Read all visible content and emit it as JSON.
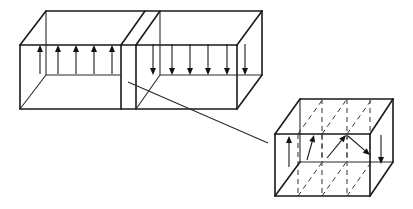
{
  "diagram": {
    "colors": {
      "line": "#1a1a1a",
      "background": "#ffffff"
    },
    "large_box": {
      "front_face": [
        [
          20,
          45
        ],
        [
          237,
          45
        ],
        [
          237,
          109
        ],
        [
          20,
          109
        ]
      ],
      "back_face": [
        [
          46,
          11
        ],
        [
          262,
          11
        ],
        [
          262,
          75
        ],
        [
          46,
          75
        ]
      ],
      "domain_wall_front": [
        [
          121,
          45
        ],
        [
          136,
          45
        ],
        [
          136,
          109
        ],
        [
          121,
          109
        ]
      ],
      "domain_wall_back": [
        [
          145,
          11
        ],
        [
          160,
          11
        ]
      ],
      "left_domain_arrows": {
        "direction": "up",
        "x": [
          40,
          58,
          76,
          94,
          112
        ],
        "y_from": 74,
        "y_to": 45
      },
      "right_domain_arrows": {
        "direction": "down",
        "x": [
          153,
          172,
          190,
          208,
          227,
          245
        ],
        "y_from": 44,
        "y_to": 75
      }
    },
    "connector_line": {
      "from": [
        128,
        82
      ],
      "to": [
        268,
        143
      ]
    },
    "magnified_wall": {
      "front_face": [
        [
          275,
          134
        ],
        [
          370,
          134
        ],
        [
          370,
          196
        ],
        [
          275,
          196
        ]
      ],
      "back_face": [
        [
          300,
          99
        ],
        [
          393,
          99
        ],
        [
          393,
          162
        ],
        [
          300,
          162
        ]
      ],
      "dashed_planes_front_x": [
        298,
        322,
        347
      ],
      "dashed_planes_back_x": [
        322,
        347,
        370
      ],
      "spin_arrows": [
        {
          "from": [
            289,
            167
          ],
          "to": [
            289,
            136
          ],
          "label": "up"
        },
        {
          "from": [
            307,
            160
          ],
          "to": [
            314,
            135
          ],
          "label": "tilted"
        },
        {
          "from": [
            327,
            158
          ],
          "to": [
            346,
            135
          ],
          "label": "tilted-more"
        },
        {
          "from": [
            348,
            136
          ],
          "to": [
            370,
            155
          ],
          "label": "tilted-down"
        },
        {
          "from": [
            381,
            135
          ],
          "to": [
            381,
            164
          ],
          "label": "down"
        }
      ]
    }
  }
}
